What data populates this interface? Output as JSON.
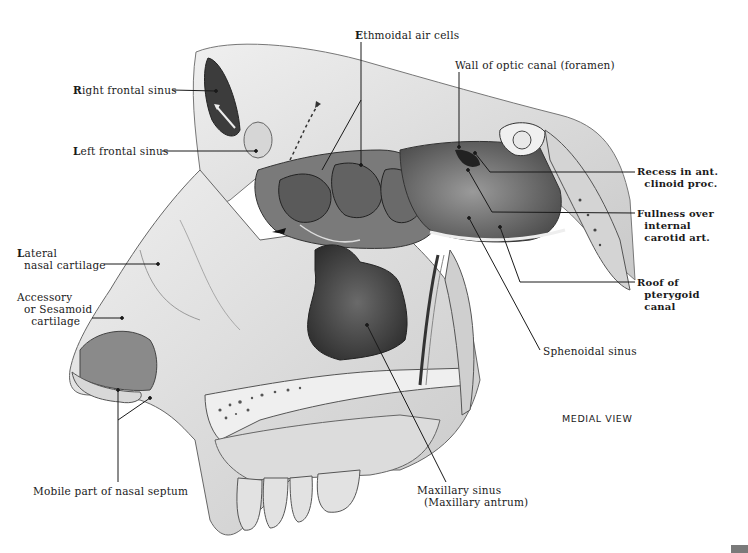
{
  "figure": {
    "view_label": "MEDIAL VIEW",
    "labels": {
      "right_frontal_sinus": "Right frontal sinus",
      "left_frontal_sinus": "Left frontal sinus",
      "ethmoidal_air_cells": "Ethmoidal air cells",
      "wall_optic_canal": "Wall of optic canal (foramen)",
      "recess_clinoid": "Recess in ant.\n  clinoid proc.",
      "fullness_carotid": "Fullness over\n  internal\n  carotid art.",
      "roof_pterygoid": "Roof of\n  pterygoid\n  canal",
      "sphenoidal_sinus": "Sphenoidal sinus",
      "lateral_nasal_cartilage": "Lateral\n  nasal cartilage",
      "accessory_cartilage": "Accessory\n  or Sesamoid\n    cartilage",
      "mobile_septum": "Mobile part of nasal septum",
      "maxillary_sinus": "Maxillary sinus\n  (Maxillary antrum)"
    },
    "colors": {
      "ink": "#1a1a1a",
      "bone_light": "#e6e6e6",
      "bone_mid": "#b8b8b8",
      "cavity_dark": "#4a4a4a",
      "cavity_darker": "#2a2a2a",
      "corner_tab": "#7a7a7a"
    }
  }
}
